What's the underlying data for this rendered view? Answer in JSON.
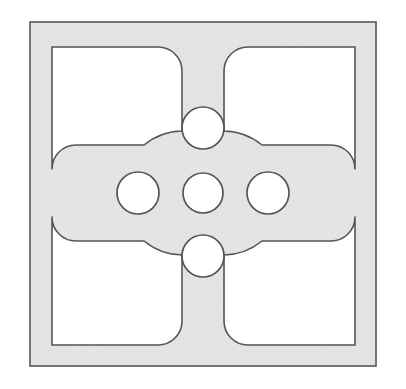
{
  "figure": {
    "title": "Perforated square plate with cruciform web and five circular holes",
    "kind": "technical-line-drawing",
    "canvas": {
      "width": 406,
      "height": 389,
      "background": "#ffffff"
    },
    "style": {
      "fill_color": "#d9d9d9",
      "stroke_color": "#555555",
      "hole_fill_color": "#ffffff",
      "stroke_width": 1.6,
      "fill_texture": "fine-noise-gray"
    },
    "outer_frame": {
      "name": "outer-square-border",
      "x": 30,
      "y": 22,
      "width": 346,
      "height": 344,
      "band_thickness": 22
    },
    "inner_window": {
      "name": "inner-square-window",
      "x": 52,
      "y": 47,
      "width": 303,
      "height": 298
    },
    "center": {
      "x": 203,
      "y": 193
    },
    "web": {
      "name": "cruciform-web",
      "lobe_radius": 62,
      "arm_half_width": 21,
      "fillet_radius": 24,
      "vertical_arm": {
        "left": 182,
        "right": 225
      },
      "horizontal_arm": {
        "top": 172,
        "bottom": 214
      }
    },
    "holes": [
      {
        "name": "center-hole",
        "label": "center",
        "cx": 203,
        "cy": 193,
        "r": 20
      },
      {
        "name": "top-hole",
        "label": "top",
        "cx": 203,
        "cy": 128,
        "r": 21
      },
      {
        "name": "bottom-hole",
        "label": "bottom",
        "cx": 203,
        "cy": 256,
        "r": 21
      },
      {
        "name": "left-hole",
        "label": "left",
        "cx": 138,
        "cy": 193,
        "r": 21
      },
      {
        "name": "right-hole",
        "label": "right",
        "cx": 268,
        "cy": 193,
        "r": 21
      }
    ],
    "quadrant_voids": [
      {
        "name": "void-top-left",
        "label": "top-left"
      },
      {
        "name": "void-top-right",
        "label": "top-right"
      },
      {
        "name": "void-bottom-left",
        "label": "bottom-left"
      },
      {
        "name": "void-bottom-right",
        "label": "bottom-right"
      }
    ],
    "counts": {
      "holes": 5,
      "voids": 4,
      "arms": 4
    }
  }
}
